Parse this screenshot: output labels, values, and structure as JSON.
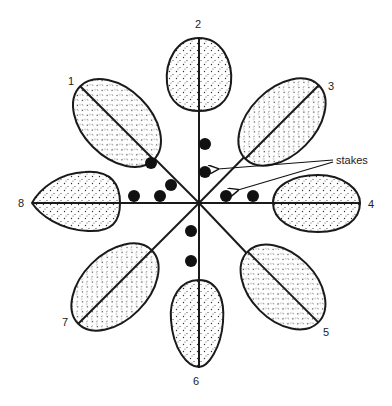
{
  "diagram": {
    "type": "radial planting layout",
    "center": [
      199,
      203
    ],
    "colors": {
      "line": "#1a1a1a",
      "leaf_fill": "#ffffff",
      "stipple": "#333333",
      "stake": "#111111"
    },
    "branches": [
      {
        "id": 1,
        "label": "1"
      },
      {
        "id": 2,
        "label": "2"
      },
      {
        "id": 3,
        "label": "3"
      },
      {
        "id": 4,
        "label": "4"
      },
      {
        "id": 5,
        "label": "5"
      },
      {
        "id": 6,
        "label": "6"
      },
      {
        "id": 7,
        "label": "7"
      },
      {
        "id": 8,
        "label": "8"
      }
    ],
    "stakes_label": "stakes",
    "stake_count": 10
  }
}
